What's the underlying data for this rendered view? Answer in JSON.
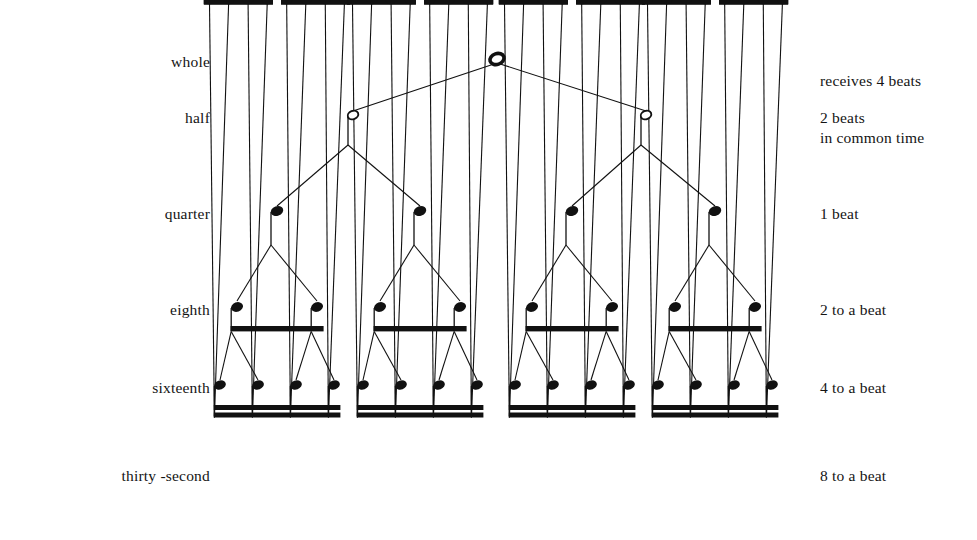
{
  "figure": {
    "background_color": "#ffffff",
    "ink_color": "#111111"
  },
  "rows": [
    {
      "id": "whole",
      "left_label": "whole",
      "right_label_lines": [
        "receives 4 beats",
        "in common time"
      ],
      "note_count": 1,
      "note_glyph": "whole-note",
      "beats": 4,
      "y": 59
    },
    {
      "id": "half",
      "left_label": "half",
      "right_label_lines": [
        "2 beats"
      ],
      "note_count": 2,
      "note_glyph": "half-note",
      "beats": 2,
      "y": 115
    },
    {
      "id": "quarter",
      "left_label": "quarter",
      "right_label_lines": [
        "1 beat"
      ],
      "note_count": 4,
      "note_glyph": "quarter-note",
      "beats": 1,
      "y": 211
    },
    {
      "id": "eighth",
      "left_label": "eighth",
      "right_label_lines": [
        "2 to a beat"
      ],
      "note_count": 8,
      "note_glyph": "eighth-note",
      "beats": 0.5,
      "y": 307
    },
    {
      "id": "sixteenth",
      "left_label": "sixteenth",
      "right_label_lines": [
        "4 to a beat"
      ],
      "note_count": 16,
      "note_glyph": "sixteenth-note",
      "beats": 0.25,
      "y": 385
    },
    {
      "id": "thirty-second",
      "left_label": "thirty -second",
      "right_label_lines": [
        "8 to a beat"
      ],
      "note_count": 32,
      "note_glyph": "thirty-second-note",
      "beats": 0.125,
      "y": 473
    }
  ],
  "label_positions": {
    "left_x": 0,
    "right_x": 820,
    "whole_left_y": 52,
    "whole_right_y": 33,
    "half_y": 108,
    "quarter_y": 204,
    "eighth_y": 300,
    "sixteenth_y": 378,
    "thirtysecond_y": 466
  }
}
